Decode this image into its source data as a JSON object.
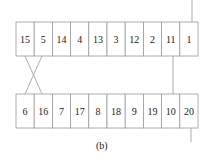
{
  "diagram": {
    "top_row": [
      "15",
      "5",
      "14",
      "4",
      "13",
      "3",
      "12",
      "2",
      "11",
      "1"
    ],
    "bottom_row": [
      "6",
      "16",
      "7",
      "17",
      "8",
      "18",
      "9",
      "19",
      "10",
      "20"
    ],
    "caption": "(b)",
    "colors": {
      "stroke": "#999999",
      "text": "#222222",
      "background": "#ffffff"
    }
  }
}
